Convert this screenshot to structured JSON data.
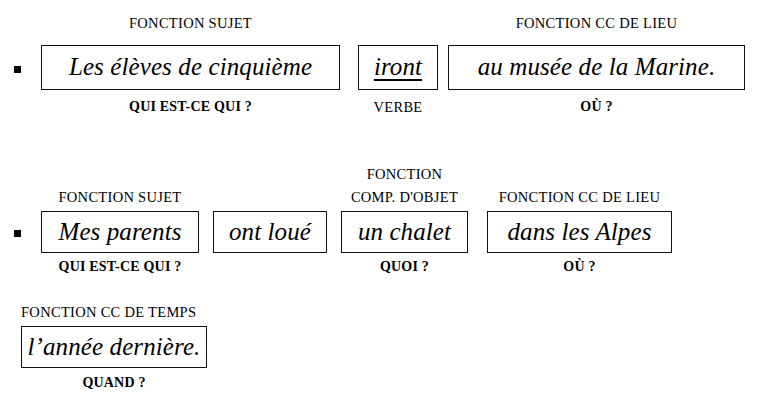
{
  "document": {
    "kind": "french-grammar-sentence-analysis-worksheet",
    "colors": {
      "ink": "#000000",
      "box_border": "#111111",
      "page_background": "#ffffff"
    }
  },
  "sentences": [
    {
      "bullet": "■",
      "groups": [
        {
          "function_label": "FONCTION SUJET",
          "text": "Les élèves de cinquième",
          "underlined": false,
          "question_label": "QUI EST-CE QUI ?",
          "question_bold": true
        },
        {
          "function_label": "",
          "text": "iront",
          "underlined": true,
          "question_label": "VERBE",
          "question_bold": false
        },
        {
          "function_label": "FONCTION CC DE LIEU",
          "text": "au musée de la Marine.",
          "underlined": false,
          "question_label": "OÙ ?",
          "question_bold": true
        }
      ]
    },
    {
      "bullet": "■",
      "groups": [
        {
          "function_label": "FONCTION SUJET",
          "text": "Mes parents",
          "underlined": false,
          "question_label": "QUI EST-CE QUI ?",
          "question_bold": true
        },
        {
          "function_label": "",
          "text": "ont loué",
          "underlined": false,
          "question_label": "",
          "question_bold": false
        },
        {
          "function_label": "FONCTION\nCOMP. D'OBJET",
          "function_label_line1": "FONCTION",
          "function_label_line2": "COMP. D'OBJET",
          "text": "un chalet",
          "underlined": false,
          "question_label": "QUOI ?",
          "question_bold": true
        },
        {
          "function_label": "FONCTION CC DE LIEU",
          "text": "dans les Alpes",
          "underlined": false,
          "question_label": "OÙ ?",
          "question_bold": true
        }
      ]
    },
    {
      "bullet": "",
      "groups": [
        {
          "function_label": "FONCTION CC DE TEMPS",
          "text": "l’année dernière.",
          "underlined": false,
          "question_label": "QUAND ?",
          "question_bold": true
        }
      ]
    }
  ]
}
